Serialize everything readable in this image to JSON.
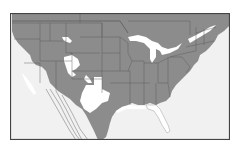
{
  "map": {
    "subject": "Contiguous United States with state boundaries and parts of Canada and Mexico",
    "colors": {
      "land_shaded": "#8c8c8c",
      "ocean": "#f1f1f1",
      "unshaded_area": "#ffffff",
      "border": "#555555",
      "frame": "#444444"
    },
    "legend": null
  }
}
